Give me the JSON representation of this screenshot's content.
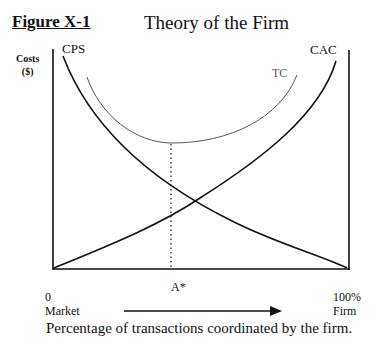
{
  "figure": {
    "label": "Figure X-1",
    "title": "Theory of the Firm",
    "y_axis_label_line1": "Costs",
    "y_axis_label_line2": "($)",
    "caption": "Percentage of transactions coordinated by the firm."
  },
  "x_axis": {
    "left_value": "0",
    "left_label": "Market",
    "right_value": "100%",
    "right_label": "Firm",
    "marker_label": "A*"
  },
  "curves": {
    "cps": {
      "label": "CPS",
      "color": "#111111"
    },
    "cac": {
      "label": "CAC",
      "color": "#111111"
    },
    "tc": {
      "label": "TC",
      "color": "#555555"
    }
  }
}
